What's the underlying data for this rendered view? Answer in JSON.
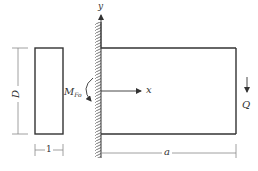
{
  "diagram": {
    "labels": {
      "y_axis": "y",
      "x_axis": "x",
      "moment": "M",
      "moment_sub": "Fo",
      "load": "Q",
      "height": "D",
      "thickness": "1",
      "length": "a"
    },
    "colors": {
      "line": "#333333",
      "dim_line": "#888888",
      "background": "#ffffff"
    }
  }
}
